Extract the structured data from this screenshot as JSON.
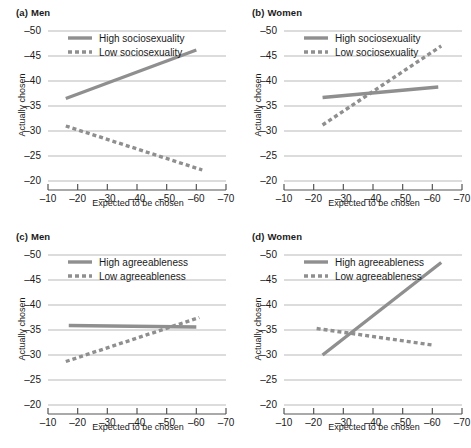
{
  "figure": {
    "background": "#ffffff",
    "line_color": "#8f8f8f",
    "grid_color": "#b9b9b9",
    "axis_color": "#555555",
    "text_color": "#1a1a1a"
  },
  "panels": [
    {
      "key": "a",
      "label": "(a)",
      "title": "Men",
      "chart_data": {
        "type": "line",
        "title": "(a) Men",
        "xlabel": "Expected to be chosen",
        "ylabel": "Actually chosen",
        "xticks": [
          -10,
          -20,
          -30,
          -40,
          -50,
          -60,
          -70
        ],
        "yticks": [
          -50,
          -45,
          -40,
          -35,
          -30,
          -25,
          -20
        ],
        "xlim": [
          -10,
          -70
        ],
        "ylim": [
          -20,
          -50
        ],
        "grid": true,
        "legend_position": "top-left-inside",
        "series": [
          {
            "name": "High sociosexuality",
            "style": "solid",
            "x": [
              -16,
              -60
            ],
            "y": [
              -36.5,
              -46.2
            ]
          },
          {
            "name": "Low sociosexuality",
            "style": "dotted",
            "x": [
              -16,
              -62
            ],
            "y": [
              -31.0,
              -22.2
            ]
          }
        ]
      }
    },
    {
      "key": "b",
      "label": "(b)",
      "title": "Women",
      "chart_data": {
        "type": "line",
        "title": "(b) Women",
        "xlabel": "Expected to be chosen",
        "ylabel": "Actually chosen",
        "xticks": [
          -10,
          -20,
          -30,
          -40,
          -50,
          -60,
          -70
        ],
        "yticks": [
          -50,
          -45,
          -40,
          -35,
          -30,
          -25,
          -20
        ],
        "xlim": [
          -10,
          -70
        ],
        "ylim": [
          -20,
          -50
        ],
        "grid": true,
        "legend_position": "top-left-inside",
        "series": [
          {
            "name": "High sociosexuality",
            "style": "solid",
            "x": [
              -23,
              -62
            ],
            "y": [
              -36.7,
              -38.8
            ]
          },
          {
            "name": "Low sociosexuality",
            "style": "dotted",
            "x": [
              -23,
              -63
            ],
            "y": [
              -31.2,
              -47.0
            ]
          }
        ]
      }
    },
    {
      "key": "c",
      "label": "(c)",
      "title": "Men",
      "chart_data": {
        "type": "line",
        "title": "(c) Men",
        "xlabel": "Expected to be chosen",
        "ylabel": "Actually chosen",
        "xticks": [
          -10,
          -20,
          -30,
          -40,
          -50,
          -60,
          -70
        ],
        "yticks": [
          -50,
          -45,
          -40,
          -35,
          -30,
          -25,
          -20
        ],
        "xlim": [
          -10,
          -70
        ],
        "ylim": [
          -20,
          -50
        ],
        "grid": true,
        "legend_position": "top-left-inside",
        "series": [
          {
            "name": "High agreeableness",
            "style": "solid",
            "x": [
              -17,
              -60
            ],
            "y": [
              -35.9,
              -35.6
            ]
          },
          {
            "name": "Low agreeableness",
            "style": "dotted",
            "x": [
              -16,
              -61
            ],
            "y": [
              -28.7,
              -37.5
            ]
          }
        ]
      }
    },
    {
      "key": "d",
      "label": "(d)",
      "title": "Women",
      "chart_data": {
        "type": "line",
        "title": "(d) Women",
        "xlabel": "Expected to be chosen",
        "ylabel": "Actually chosen",
        "xticks": [
          -10,
          -20,
          -30,
          -40,
          -50,
          -60,
          -70
        ],
        "yticks": [
          -50,
          -45,
          -40,
          -35,
          -30,
          -25,
          -20
        ],
        "xlim": [
          -10,
          -70
        ],
        "ylim": [
          -20,
          -50
        ],
        "grid": true,
        "legend_position": "top-left-inside",
        "series": [
          {
            "name": "High agreeableness",
            "style": "solid",
            "x": [
              -23,
              -63
            ],
            "y": [
              -30.0,
              -48.5
            ]
          },
          {
            "name": "Low agreeableness",
            "style": "dotted",
            "x": [
              -21,
              -60
            ],
            "y": [
              -35.3,
              -32.0
            ]
          }
        ]
      }
    }
  ]
}
